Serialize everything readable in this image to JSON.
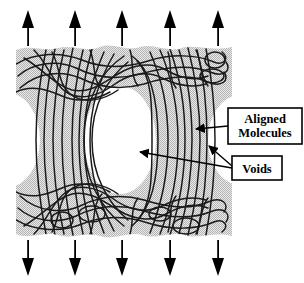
{
  "figure": {
    "type": "diagram",
    "background_color": "#ffffff",
    "specimen_fill_color": "#d2d2d2",
    "chain_color": "#1a1a1a",
    "void_color": "#ffffff",
    "arrow_color": "#000000",
    "label_box_border_color": "#000000",
    "label_box_fill_color": "#ffffff"
  },
  "labels": {
    "aligned_molecules": {
      "line1": "Aligned",
      "line2": "Molecules",
      "box": {
        "x": 228,
        "y": 108,
        "width": 74,
        "height": 36
      }
    },
    "voids": {
      "line1": "Voids",
      "box": {
        "x": 232,
        "y": 156,
        "width": 50,
        "height": 24
      }
    }
  },
  "leaders": [
    {
      "name": "aligned-molecules-leader",
      "from_x": 228,
      "from_y": 126,
      "to_x": 192,
      "to_y": 129
    },
    {
      "name": "voids-leader-center",
      "from_x": 232,
      "from_y": 168,
      "to_x": 135,
      "to_y": 152
    },
    {
      "name": "voids-leader-right",
      "from_x": 232,
      "from_y": 166,
      "to_x": 205,
      "to_y": 143
    }
  ],
  "tension_arrows": {
    "direction_top": "up",
    "direction_bottom": "down",
    "count_top": 5,
    "count_bottom": 5,
    "top_x_positions": [
      28,
      75,
      122,
      170,
      218
    ],
    "bottom_x_positions": [
      28,
      75,
      122,
      170,
      218
    ],
    "top_tip_y": 10,
    "top_tail_y": 46,
    "bottom_tip_y": 276,
    "bottom_tail_y": 240
  },
  "voids_geometry": {
    "center": {
      "cx": 120,
      "cy": 140,
      "rx": 36,
      "ry": 54
    },
    "left_edge": {
      "cx": 10,
      "cy": 140,
      "rx": 30,
      "ry": 46
    },
    "right_edge": {
      "cx": 236,
      "cy": 140,
      "rx": 28,
      "ry": 44
    }
  },
  "regions": {
    "top_tangled": "randomly coiled molecules",
    "middle_aligned": "drawn, oriented molecular chains",
    "bottom_tangled": "randomly coiled molecules"
  }
}
